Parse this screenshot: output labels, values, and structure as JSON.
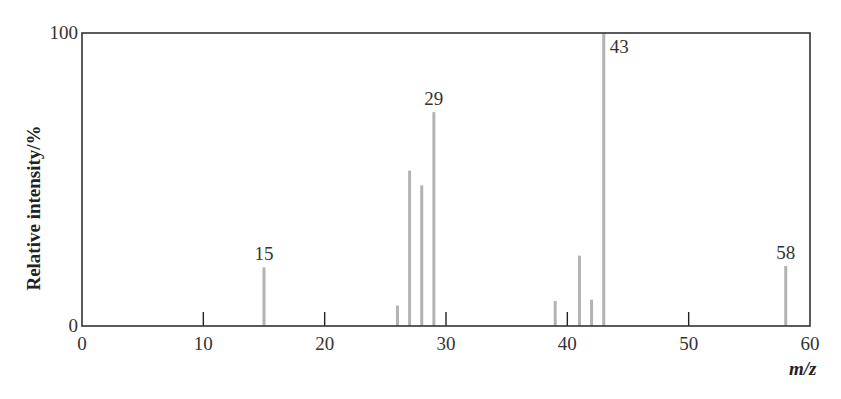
{
  "chart_data": {
    "type": "bar",
    "subtype": "stick-spectrum",
    "title": "",
    "xlabel": "m/z",
    "ylabel": "Relative intensity/%",
    "xlim": [
      0,
      60
    ],
    "ylim": [
      0,
      100
    ],
    "xticks": [
      0,
      10,
      20,
      30,
      40,
      50,
      60
    ],
    "yticks": [
      0,
      100
    ],
    "grid": false,
    "legend": null,
    "x": [
      15,
      26,
      27,
      28,
      29,
      39,
      41,
      42,
      43,
      58
    ],
    "values": [
      20,
      7,
      53,
      48,
      73,
      8.5,
      24,
      9,
      100,
      20.5
    ],
    "annotations": [
      {
        "x": 15,
        "label": "15"
      },
      {
        "x": 29,
        "label": "29"
      },
      {
        "x": 43,
        "label": "43"
      },
      {
        "x": 58,
        "label": "58"
      }
    ],
    "colors": {
      "bar": "#b3b3b3",
      "axis": "#333333",
      "tick": "#222222"
    }
  }
}
